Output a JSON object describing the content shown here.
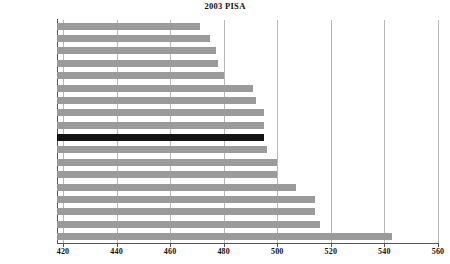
{
  "chart_data": {
    "type": "bar",
    "orientation": "horizontal",
    "title": "2003 PISA",
    "xlabel": "",
    "ylabel": "",
    "xlim": [
      420,
      560
    ],
    "xticks": [
      420,
      440,
      460,
      480,
      500,
      520,
      540,
      560
    ],
    "grid": true,
    "legend": false,
    "highlight_category": "United States",
    "colors": {
      "bar": "#9b9b9b",
      "highlight_bar": "#141414",
      "gridline": "#b8b8b8",
      "axis": "#555555",
      "text": "#111111",
      "background": "#ffffff"
    },
    "categories": [
      "Greece",
      "Italy",
      "Portugal",
      "Luxembourg",
      "Spain",
      "Germany",
      "Austria",
      "Denmark",
      "Iceland",
      "United States",
      "France",
      "Switzerland",
      "Norway",
      "Belgium",
      "Netherlands",
      "Sweden",
      "Ireland",
      "Finland"
    ],
    "values": [
      471,
      475,
      477,
      478,
      480,
      491,
      492,
      495,
      495,
      495,
      496,
      500,
      500,
      507,
      514,
      514,
      516,
      543
    ]
  }
}
